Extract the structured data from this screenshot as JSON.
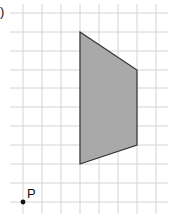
{
  "diagram": {
    "type": "grid-polygon",
    "corner_mark": ")",
    "grid": {
      "cell_size_px": 19,
      "vertical_x": [
        23,
        42,
        61,
        80,
        99,
        118,
        137,
        156
      ],
      "horizontal_y": [
        13,
        32,
        51,
        70,
        88,
        107,
        126,
        145,
        164,
        183,
        202
      ],
      "line_color": "#d4d4d4"
    },
    "shape": {
      "name": "trapezium",
      "vertices_px": [
        [
          80,
          32
        ],
        [
          137,
          70
        ],
        [
          137,
          145
        ],
        [
          80,
          164
        ]
      ],
      "vertices_grid": [
        [
          3,
          10
        ],
        [
          6,
          8
        ],
        [
          6,
          4
        ],
        [
          3,
          3
        ]
      ],
      "fill": "#a9a9a9",
      "stroke": "#333333"
    },
    "point": {
      "label": "P",
      "position_px": [
        23,
        202
      ],
      "position_grid": [
        0,
        0
      ]
    }
  }
}
